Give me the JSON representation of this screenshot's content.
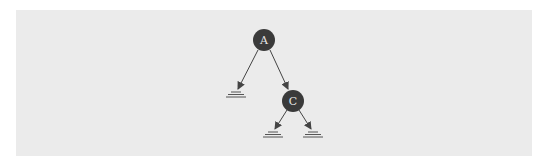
{
  "diagram": {
    "type": "binary-tree",
    "colors": {
      "background": "#ebebeb",
      "node_fill": "#3a3a3a",
      "node_text": "#e6e6e6",
      "edge": "#444444"
    },
    "nodes": [
      {
        "id": "A",
        "label": "A",
        "cx": 264,
        "cy": 40
      },
      {
        "id": "C",
        "label": "C",
        "cx": 293,
        "cy": 101
      }
    ],
    "null_leaves": [
      {
        "parent": "A",
        "x": 236,
        "y": 92
      },
      {
        "parent": "C",
        "x": 273,
        "y": 132
      },
      {
        "parent": "C",
        "x": 313,
        "y": 132
      }
    ],
    "edges": [
      {
        "from": "A",
        "to": "null-left"
      },
      {
        "from": "A",
        "to": "C"
      },
      {
        "from": "C",
        "to": "null-left"
      },
      {
        "from": "C",
        "to": "null-right"
      }
    ]
  }
}
